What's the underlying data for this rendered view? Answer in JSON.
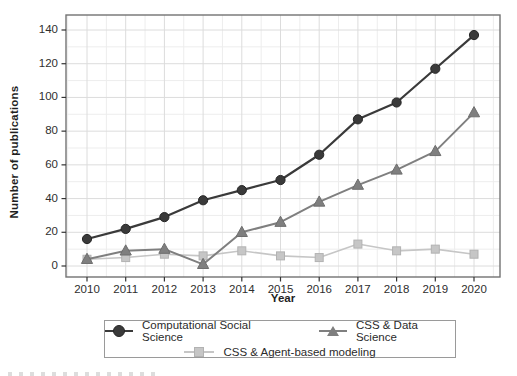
{
  "figure": {
    "background": "#ffffff",
    "frame_color": "#737373",
    "grid_major_color": "#dcdcdc",
    "grid_minor_color": "#ededed",
    "tick_label_color": "#2e2e2e"
  },
  "chart_data": {
    "type": "line",
    "title": "",
    "xlabel": "Year",
    "ylabel": "Number of publications",
    "x": [
      2010,
      2011,
      2012,
      2013,
      2014,
      2015,
      2016,
      2017,
      2018,
      2019,
      2020
    ],
    "ylim": [
      0,
      140
    ],
    "yticks": [
      0,
      20,
      40,
      60,
      80,
      100,
      120,
      140
    ],
    "minor_grid_step": 10,
    "grid": true,
    "legend_position": "bottom",
    "series": [
      {
        "name": "Computational Social Science",
        "marker": "circle",
        "color": "#3a3a3a",
        "line_width": 2.2,
        "values": [
          16,
          22,
          29,
          39,
          45,
          51,
          66,
          87,
          97,
          117,
          137
        ]
      },
      {
        "name": "CSS & Data Science",
        "marker": "triangle",
        "color": "#7f7f7f",
        "line_width": 2,
        "values": [
          4,
          9,
          10,
          1,
          20,
          26,
          38,
          48,
          57,
          68,
          91
        ]
      },
      {
        "name": "CSS & Agent-based modeling",
        "marker": "square",
        "color": "#c6c6c6",
        "line_width": 1.6,
        "values": [
          4,
          5,
          7,
          6,
          9,
          6,
          5,
          13,
          9,
          10,
          7
        ]
      }
    ]
  }
}
